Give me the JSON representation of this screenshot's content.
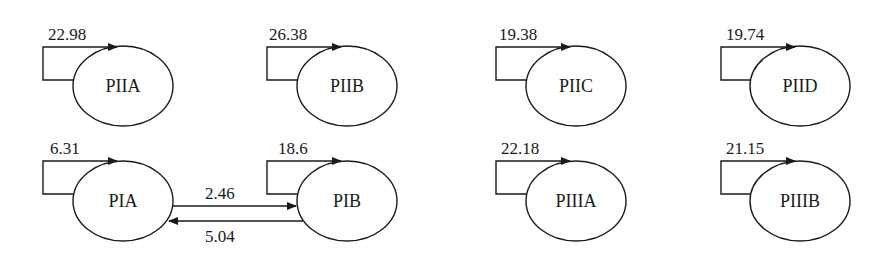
{
  "diagram": {
    "type": "state-transition",
    "nodes": [
      {
        "id": "PIIA",
        "label": "PIIA",
        "self_loop": "22.98"
      },
      {
        "id": "PIIB",
        "label": "PIIB",
        "self_loop": "26.38"
      },
      {
        "id": "PIIC",
        "label": "PIIC",
        "self_loop": "19.38"
      },
      {
        "id": "PIID",
        "label": "PIID",
        "self_loop": "19.74"
      },
      {
        "id": "PIA",
        "label": "PIA",
        "self_loop": "6.31"
      },
      {
        "id": "PIB",
        "label": "PIB",
        "self_loop": "18.6"
      },
      {
        "id": "PIIIA",
        "label": "PIIIA",
        "self_loop": "22.18"
      },
      {
        "id": "PIIIB",
        "label": "PIIIB",
        "self_loop": "21.15"
      }
    ],
    "edges": [
      {
        "from": "PIA",
        "to": "PIB",
        "label": "2.46"
      },
      {
        "from": "PIB",
        "to": "PIA",
        "label": "5.04"
      }
    ]
  }
}
